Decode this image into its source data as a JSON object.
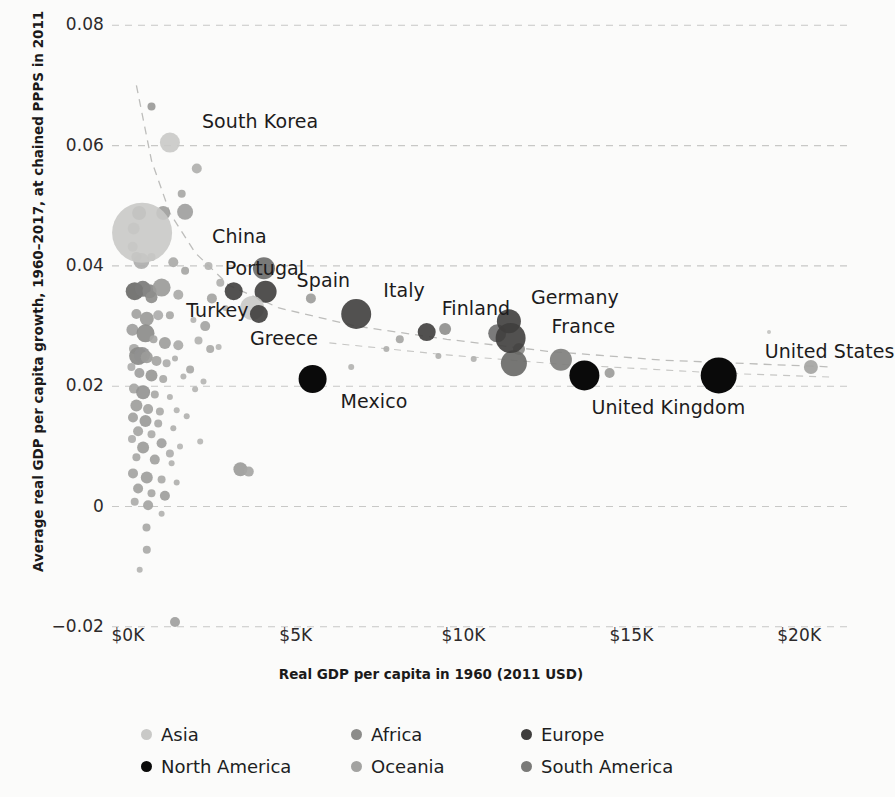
{
  "chart_data": {
    "type": "scatter",
    "title": "",
    "xlabel": "Real GDP per capita in 1960 (2011 USD)",
    "ylabel": "Average real GDP per capita growth, 1960–2017, at chained PPPS in 2011",
    "xlim": [
      0,
      21500
    ],
    "ylim": [
      -0.02,
      0.08
    ],
    "xticks": [
      0,
      5000,
      10000,
      15000,
      20000
    ],
    "xticklabels": [
      "$0K",
      "$5K",
      "$10K",
      "$15K",
      "$20K"
    ],
    "yticks": [
      -0.02,
      0,
      0.02,
      0.04,
      0.06,
      0.08
    ],
    "yticklabels": [
      "−0.02",
      "0",
      "0.02",
      "0.04",
      "0.06",
      "0.08"
    ],
    "grid": "horizontal-dashed",
    "legend_position": "bottom",
    "size_encoding": "population",
    "color_encoding": "continent",
    "trendline": "dashed-gray-downward",
    "labeled_points": [
      {
        "name": "South Korea",
        "x": 1250,
        "y": 0.0605,
        "r": 10,
        "continent": "Asia",
        "label_dx": 22,
        "label_dy": -22
      },
      {
        "name": "China",
        "x": 420,
        "y": 0.0455,
        "r": 30,
        "continent": "Asia",
        "label_dx": 40,
        "label_dy": 3
      },
      {
        "name": "Portugal",
        "x": 3150,
        "y": 0.0358,
        "r": 9,
        "continent": "Europe",
        "label_dx": -18,
        "label_dy": -23
      },
      {
        "name": "Spain",
        "x": 4100,
        "y": 0.0357,
        "r": 11,
        "continent": "Europe",
        "label_dx": 20,
        "label_dy": -12
      },
      {
        "name": "Turkey",
        "x": 3700,
        "y": 0.033,
        "r": 12,
        "continent": "Asia",
        "label_dx": -78,
        "label_dy": 2
      },
      {
        "name": "Greece",
        "x": 3900,
        "y": 0.032,
        "r": 9,
        "continent": "Europe",
        "label_dx": -18,
        "label_dy": 24
      },
      {
        "name": "Italy",
        "x": 6800,
        "y": 0.032,
        "r": 15,
        "continent": "Europe",
        "label_dx": 12,
        "label_dy": -24
      },
      {
        "name": "Finland",
        "x": 8900,
        "y": 0.029,
        "r": 9,
        "continent": "Europe",
        "label_dx": 6,
        "label_dy": -24
      },
      {
        "name": "Germany",
        "x": 11350,
        "y": 0.0308,
        "r": 12,
        "continent": "Europe",
        "label_dx": 10,
        "label_dy": -24
      },
      {
        "name": "France",
        "x": 11400,
        "y": 0.028,
        "r": 15,
        "continent": "Europe",
        "label_dx": 26,
        "label_dy": -12
      },
      {
        "name": "United Kingdom",
        "x": 13600,
        "y": 0.0218,
        "r": 15,
        "continent": "North America",
        "label_dx": -8,
        "label_dy": 32
      },
      {
        "name": "Mexico",
        "x": 5500,
        "y": 0.0212,
        "r": 14,
        "continent": "North America",
        "label_dx": 14,
        "label_dy": 22
      },
      {
        "name": "United States",
        "x": 17600,
        "y": 0.0218,
        "r": 18,
        "continent": "North America",
        "label_dx": 28,
        "label_dy": -24
      }
    ],
    "continent_colors": {
      "Asia": "#c9c9c7",
      "Africa": "#8c8c8a",
      "Europe": "#3f3e3d",
      "North America": "#0a0a0a",
      "Oceania": "#a3a3a1",
      "South America": "#7a7a78"
    }
  },
  "axes": {
    "x_title": "Real GDP per capita in 1960 (2011 USD)",
    "y_title": "Average real GDP per capita growth, 1960–2017, at chained PPPS in 2011",
    "x_tick_labels": [
      "$0K",
      "$5K",
      "$10K",
      "$15K",
      "$20K"
    ],
    "y_tick_labels": [
      "0.08",
      "0.06",
      "0.04",
      "0.02",
      "0",
      "−0.02"
    ]
  },
  "legend": {
    "rows": [
      [
        {
          "label": "Asia",
          "color": "#c9c9c7"
        },
        {
          "label": "Africa",
          "color": "#8c8c8a"
        },
        {
          "label": "Europe",
          "color": "#3f3e3d"
        }
      ],
      [
        {
          "label": "North America",
          "color": "#0a0a0a"
        },
        {
          "label": "Oceania",
          "color": "#a3a3a1"
        },
        {
          "label": "South America",
          "color": "#7a7a78"
        }
      ]
    ]
  },
  "unlabeled_points": [
    {
      "x": 700,
      "y": 0.0665,
      "r": 4,
      "c": "#9a9a98"
    },
    {
      "x": 2050,
      "y": 0.0562,
      "r": 5,
      "c": "#b0b0ae"
    },
    {
      "x": 1600,
      "y": 0.052,
      "r": 4,
      "c": "#a8a8a6"
    },
    {
      "x": 1050,
      "y": 0.0488,
      "r": 7,
      "c": "#9e9e9c"
    },
    {
      "x": 1700,
      "y": 0.049,
      "r": 8,
      "c": "#a0a09e"
    },
    {
      "x": 330,
      "y": 0.0488,
      "r": 7,
      "c": "#8e8e8c"
    },
    {
      "x": 170,
      "y": 0.0462,
      "r": 6,
      "c": "#b5b5b3"
    },
    {
      "x": 140,
      "y": 0.0432,
      "r": 5,
      "c": "#b8b8b6"
    },
    {
      "x": 400,
      "y": 0.0408,
      "r": 8,
      "c": "#aeaeac"
    },
    {
      "x": 1350,
      "y": 0.0406,
      "r": 5,
      "c": "#aaaaa8"
    },
    {
      "x": 1700,
      "y": 0.0392,
      "r": 4,
      "c": "#a6a6a4"
    },
    {
      "x": 2400,
      "y": 0.04,
      "r": 4,
      "c": "#b4b4b2"
    },
    {
      "x": 4050,
      "y": 0.0396,
      "r": 11,
      "c": "#6e6e6c"
    },
    {
      "x": 200,
      "y": 0.0358,
      "r": 9,
      "c": "#6b6b69"
    },
    {
      "x": 440,
      "y": 0.0362,
      "r": 8,
      "c": "#7a7a78"
    },
    {
      "x": 640,
      "y": 0.0358,
      "r": 7,
      "c": "#868684"
    },
    {
      "x": 1000,
      "y": 0.0364,
      "r": 9,
      "c": "#9b9b99"
    },
    {
      "x": 1500,
      "y": 0.0352,
      "r": 5,
      "c": "#aaaaa8"
    },
    {
      "x": 2500,
      "y": 0.0346,
      "r": 5,
      "c": "#a4a4a2"
    },
    {
      "x": 5450,
      "y": 0.0346,
      "r": 5,
      "c": "#9d9d9b"
    },
    {
      "x": 9450,
      "y": 0.0295,
      "r": 6,
      "c": "#8f8f8d"
    },
    {
      "x": 11000,
      "y": 0.0288,
      "r": 9,
      "c": "#707070"
    },
    {
      "x": 11650,
      "y": 0.0262,
      "r": 6,
      "c": "#8a8a88"
    },
    {
      "x": 11500,
      "y": 0.0238,
      "r": 13,
      "c": "#6a6a68"
    },
    {
      "x": 12900,
      "y": 0.0244,
      "r": 11,
      "c": "#7f7f7d"
    },
    {
      "x": 14350,
      "y": 0.0222,
      "r": 5,
      "c": "#9c9c9a"
    },
    {
      "x": 9250,
      "y": 0.025,
      "r": 3,
      "c": "#b0b0ae"
    },
    {
      "x": 10300,
      "y": 0.0245,
      "r": 3,
      "c": "#b2b2b0"
    },
    {
      "x": 20350,
      "y": 0.0232,
      "r": 7,
      "c": "#a5a5a3"
    },
    {
      "x": 19100,
      "y": 0.029,
      "r": 2,
      "c": "#c3c3c1"
    },
    {
      "x": 250,
      "y": 0.032,
      "r": 5,
      "c": "#a2a2a0"
    },
    {
      "x": 560,
      "y": 0.0312,
      "r": 7,
      "c": "#9a9a98"
    },
    {
      "x": 900,
      "y": 0.0318,
      "r": 5,
      "c": "#adadab"
    },
    {
      "x": 1250,
      "y": 0.0318,
      "r": 4,
      "c": "#a8a8a6"
    },
    {
      "x": 1950,
      "y": 0.031,
      "r": 3,
      "c": "#b4b4b2"
    },
    {
      "x": 130,
      "y": 0.0294,
      "r": 6,
      "c": "#a0a09e"
    },
    {
      "x": 520,
      "y": 0.0288,
      "r": 9,
      "c": "#8c8c8a"
    },
    {
      "x": 760,
      "y": 0.0278,
      "r": 4,
      "c": "#a6a6a4"
    },
    {
      "x": 1100,
      "y": 0.0272,
      "r": 6,
      "c": "#9e9e9c"
    },
    {
      "x": 1500,
      "y": 0.0268,
      "r": 5,
      "c": "#aaaaa8"
    },
    {
      "x": 2100,
      "y": 0.0276,
      "r": 4,
      "c": "#b2b2b0"
    },
    {
      "x": 2700,
      "y": 0.0265,
      "r": 3,
      "c": "#b6b6b4"
    },
    {
      "x": 180,
      "y": 0.0262,
      "r": 5,
      "c": "#a8a8a6"
    },
    {
      "x": 300,
      "y": 0.025,
      "r": 9,
      "c": "#8a8a88"
    },
    {
      "x": 420,
      "y": 0.0252,
      "r": 8,
      "c": "#909090"
    },
    {
      "x": 560,
      "y": 0.0248,
      "r": 6,
      "c": "#9c9c9a"
    },
    {
      "x": 850,
      "y": 0.0242,
      "r": 5,
      "c": "#a4a4a2"
    },
    {
      "x": 1150,
      "y": 0.0238,
      "r": 4,
      "c": "#adadab"
    },
    {
      "x": 1400,
      "y": 0.0246,
      "r": 3,
      "c": "#b0b0ae"
    },
    {
      "x": 100,
      "y": 0.0232,
      "r": 4,
      "c": "#aeaeac"
    },
    {
      "x": 340,
      "y": 0.0222,
      "r": 5,
      "c": "#a0a09e"
    },
    {
      "x": 700,
      "y": 0.0218,
      "r": 6,
      "c": "#989896"
    },
    {
      "x": 1050,
      "y": 0.0212,
      "r": 4,
      "c": "#a9a9a7"
    },
    {
      "x": 1650,
      "y": 0.0216,
      "r": 3,
      "c": "#b3b3b1"
    },
    {
      "x": 2250,
      "y": 0.0208,
      "r": 3,
      "c": "#b5b5b3"
    },
    {
      "x": 180,
      "y": 0.0196,
      "r": 5,
      "c": "#a6a6a4"
    },
    {
      "x": 450,
      "y": 0.019,
      "r": 7,
      "c": "#949492"
    },
    {
      "x": 800,
      "y": 0.0186,
      "r": 4,
      "c": "#a8a8a6"
    },
    {
      "x": 1250,
      "y": 0.0182,
      "r": 3,
      "c": "#b2b2b0"
    },
    {
      "x": 250,
      "y": 0.0168,
      "r": 6,
      "c": "#9e9e9c"
    },
    {
      "x": 600,
      "y": 0.0162,
      "r": 5,
      "c": "#a4a4a2"
    },
    {
      "x": 950,
      "y": 0.0158,
      "r": 4,
      "c": "#aaaaa8"
    },
    {
      "x": 1450,
      "y": 0.016,
      "r": 3,
      "c": "#b4b4b2"
    },
    {
      "x": 150,
      "y": 0.0148,
      "r": 5,
      "c": "#a2a2a0"
    },
    {
      "x": 520,
      "y": 0.0142,
      "r": 6,
      "c": "#9a9a98"
    },
    {
      "x": 900,
      "y": 0.0138,
      "r": 4,
      "c": "#a9a9a7"
    },
    {
      "x": 1350,
      "y": 0.013,
      "r": 3,
      "c": "#b0b0ae"
    },
    {
      "x": 300,
      "y": 0.0125,
      "r": 5,
      "c": "#a5a5a3"
    },
    {
      "x": 700,
      "y": 0.012,
      "r": 4,
      "c": "#acacaa"
    },
    {
      "x": 120,
      "y": 0.0112,
      "r": 4,
      "c": "#aeaeac"
    },
    {
      "x": 1000,
      "y": 0.0105,
      "r": 5,
      "c": "#a0a09e"
    },
    {
      "x": 450,
      "y": 0.0098,
      "r": 6,
      "c": "#9c9c9a"
    },
    {
      "x": 1550,
      "y": 0.01,
      "r": 3,
      "c": "#b6b6b4"
    },
    {
      "x": 250,
      "y": 0.0082,
      "r": 4,
      "c": "#a8a8a6"
    },
    {
      "x": 800,
      "y": 0.0078,
      "r": 5,
      "c": "#a2a2a0"
    },
    {
      "x": 1300,
      "y": 0.0072,
      "r": 3,
      "c": "#b2b2b0"
    },
    {
      "x": 3350,
      "y": 0.0062,
      "r": 7,
      "c": "#9c9c9a"
    },
    {
      "x": 3600,
      "y": 0.0058,
      "r": 5,
      "c": "#a6a6a4"
    },
    {
      "x": 150,
      "y": 0.0055,
      "r": 5,
      "c": "#a4a4a2"
    },
    {
      "x": 560,
      "y": 0.0048,
      "r": 6,
      "c": "#9e9e9c"
    },
    {
      "x": 1000,
      "y": 0.0045,
      "r": 4,
      "c": "#aaaaa8"
    },
    {
      "x": 1450,
      "y": 0.004,
      "r": 3,
      "c": "#b0b0ae"
    },
    {
      "x": 300,
      "y": 0.003,
      "r": 5,
      "c": "#a2a2a0"
    },
    {
      "x": 700,
      "y": 0.0022,
      "r": 4,
      "c": "#a8a8a6"
    },
    {
      "x": 1100,
      "y": 0.0018,
      "r": 5,
      "c": "#9e9e9c"
    },
    {
      "x": 200,
      "y": 0.0008,
      "r": 4,
      "c": "#acacaa"
    },
    {
      "x": 600,
      "y": 0.0002,
      "r": 5,
      "c": "#a4a4a2"
    },
    {
      "x": 1000,
      "y": -0.0012,
      "r": 3,
      "c": "#b2b2b0"
    },
    {
      "x": 550,
      "y": -0.0035,
      "r": 4,
      "c": "#a8a8a6"
    },
    {
      "x": 560,
      "y": -0.0072,
      "r": 4,
      "c": "#aaaaa8"
    },
    {
      "x": 350,
      "y": -0.0105,
      "r": 3,
      "c": "#b4b4b2"
    },
    {
      "x": 1400,
      "y": -0.0192,
      "r": 5,
      "c": "#a0a09e"
    },
    {
      "x": 250,
      "y": 0.0415,
      "r": 5,
      "c": "#a6a6a4"
    },
    {
      "x": 700,
      "y": 0.0415,
      "r": 4,
      "c": "#adadab"
    },
    {
      "x": 2750,
      "y": 0.0372,
      "r": 4,
      "c": "#b0b0ae"
    },
    {
      "x": 2900,
      "y": 0.033,
      "r": 3,
      "c": "#b4b4b2"
    },
    {
      "x": 2300,
      "y": 0.03,
      "r": 5,
      "c": "#a4a4a2"
    },
    {
      "x": 2450,
      "y": 0.0262,
      "r": 4,
      "c": "#aaaaa8"
    },
    {
      "x": 1850,
      "y": 0.0228,
      "r": 4,
      "c": "#a8a8a6"
    },
    {
      "x": 2000,
      "y": 0.0195,
      "r": 3,
      "c": "#b5b5b3"
    },
    {
      "x": 1750,
      "y": 0.015,
      "r": 3,
      "c": "#b2b2b0"
    },
    {
      "x": 2150,
      "y": 0.0108,
      "r": 3,
      "c": "#b6b6b4"
    },
    {
      "x": 1250,
      "y": 0.0088,
      "r": 4,
      "c": "#aeaeac"
    },
    {
      "x": 6650,
      "y": 0.0232,
      "r": 3,
      "c": "#b3b3b1"
    },
    {
      "x": 7700,
      "y": 0.0262,
      "r": 3,
      "c": "#b0b0ae"
    },
    {
      "x": 8100,
      "y": 0.0278,
      "r": 4,
      "c": "#a6a6a4"
    },
    {
      "x": 700,
      "y": 0.0348,
      "r": 6,
      "c": "#8e8e8c"
    }
  ]
}
